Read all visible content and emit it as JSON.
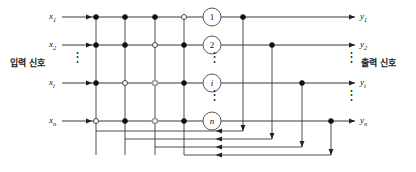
{
  "figure": {
    "type": "neural-network-diagram",
    "title": "",
    "input_side_label": "입력 신호",
    "output_side_label": "출력 신호",
    "colors": {
      "line": "#222222",
      "node_filled": "#111111",
      "node_open": "#ffffff",
      "node_open_stroke": "#333333",
      "node_faded": "#9a9a9a",
      "neuron_stroke": "#444444",
      "text": "#111111"
    }
  },
  "inputs": [
    {
      "label": "x",
      "sub": "1"
    },
    {
      "label": "x",
      "sub": "2"
    },
    {
      "label": "x",
      "sub": "i"
    },
    {
      "label": "x",
      "sub": "n"
    }
  ],
  "outputs": [
    {
      "label": "y",
      "sub": "1"
    },
    {
      "label": "y",
      "sub": "2"
    },
    {
      "label": "y",
      "sub": "i"
    },
    {
      "label": "y",
      "sub": "n"
    }
  ],
  "neurons": [
    {
      "label": "1",
      "italic": false
    },
    {
      "label": "2",
      "italic": false
    },
    {
      "label": "i",
      "italic": true
    },
    {
      "label": "n",
      "italic": true
    }
  ],
  "ellipses": [
    {
      "name": "input-ellipsis",
      "x": 75,
      "y": 62
    },
    {
      "name": "neuron-ellipsis-upper",
      "x": 212,
      "y": 62
    },
    {
      "name": "neuron-ellipsis-lower",
      "x": 212,
      "y": 100
    },
    {
      "name": "output-ellipsis-upper",
      "x": 349,
      "y": 62
    },
    {
      "name": "output-ellipsis-lower",
      "x": 349,
      "y": 100
    }
  ],
  "grid": {
    "row_y": [
      17,
      45,
      83,
      121
    ],
    "col_x": [
      96,
      125,
      155,
      184
    ],
    "junctions": [
      [
        "filled",
        "filled",
        "filled",
        "open"
      ],
      [
        "filled",
        "filled",
        "open",
        "filled"
      ],
      [
        "filled",
        "open",
        "faded",
        "filled"
      ],
      [
        "open",
        "filled",
        "faded",
        "filled"
      ]
    ]
  },
  "feedback": {
    "tap_x": [
      243,
      272,
      302,
      331
    ],
    "return_y": [
      131,
      139,
      147,
      155
    ],
    "return_arrow_x": 216,
    "riser_x": [
      96,
      125,
      155,
      184
    ]
  },
  "geometry": {
    "input_label_x": 58,
    "input_arrow_start_x": 62,
    "input_arrow_end_x": 92,
    "neuron_cx": 212,
    "neuron_r": 9,
    "output_arrow_end_x": 355,
    "output_label_x": 360
  }
}
